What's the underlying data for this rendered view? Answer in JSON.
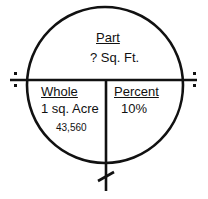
{
  "diagram": {
    "type": "percent-circle",
    "part": {
      "heading": "Part",
      "value": "? Sq. Ft."
    },
    "whole": {
      "heading": "Whole",
      "value": "1 sq. Acre",
      "subvalue": "43,560"
    },
    "percent": {
      "heading": "Percent",
      "value": "10%"
    },
    "symbols": {
      "divide": "÷",
      "multiply": "×"
    }
  }
}
